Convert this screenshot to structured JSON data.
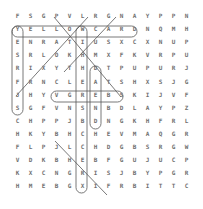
{
  "puzzle": {
    "rows": 14,
    "cols": 14,
    "grid": [
      [
        "F",
        "S",
        "G",
        "P",
        "V",
        "L",
        "R",
        "G",
        "N",
        "A",
        "Y",
        "P",
        "P",
        "N"
      ],
      [
        "Y",
        "E",
        "L",
        "L",
        "O",
        "W",
        "C",
        "A",
        "R",
        "D",
        "N",
        "Q",
        "M",
        "H"
      ],
      [
        "E",
        "N",
        "R",
        "A",
        "T",
        "I",
        "U",
        "S",
        "X",
        "C",
        "X",
        "N",
        "U",
        "P"
      ],
      [
        "S",
        "R",
        "L",
        "O",
        "K",
        "H",
        "M",
        "X",
        "F",
        "K",
        "V",
        "R",
        "P",
        "U"
      ],
      [
        "R",
        "I",
        "X",
        "Y",
        "T",
        "H",
        "D",
        "T",
        "P",
        "U",
        "P",
        "U",
        "R",
        "J"
      ],
      [
        "F",
        "R",
        "N",
        "C",
        "L",
        "E",
        "A",
        "T",
        "S",
        "H",
        "X",
        "S",
        "J",
        "G"
      ],
      [
        "J",
        "H",
        "Y",
        "V",
        "G",
        "R",
        "E",
        "B",
        "S",
        "K",
        "I",
        "J",
        "V",
        "F"
      ],
      [
        "S",
        "G",
        "F",
        "V",
        "N",
        "S",
        "N",
        "B",
        "D",
        "L",
        "A",
        "Y",
        "P",
        "Z"
      ],
      [
        "C",
        "H",
        "P",
        "P",
        "J",
        "B",
        "D",
        "N",
        "G",
        "K",
        "H",
        "F",
        "R",
        "L"
      ],
      [
        "H",
        "K",
        "Y",
        "B",
        "H",
        "C",
        "H",
        "E",
        "V",
        "M",
        "A",
        "Q",
        "G",
        "R"
      ],
      [
        "F",
        "L",
        "P",
        "J",
        "L",
        "C",
        "H",
        "D",
        "G",
        "B",
        "S",
        "R",
        "G",
        "W"
      ],
      [
        "V",
        "D",
        "K",
        "B",
        "H",
        "E",
        "B",
        "F",
        "G",
        "U",
        "J",
        "U",
        "C",
        "P"
      ],
      [
        "K",
        "X",
        "C",
        "N",
        "G",
        "R",
        "I",
        "S",
        "J",
        "B",
        "Y",
        "P",
        "G",
        "R"
      ],
      [
        "H",
        "M",
        "E",
        "B",
        "G",
        "X",
        "I",
        "F",
        "R",
        "B",
        "I",
        "T",
        "T",
        "C"
      ]
    ],
    "found_words": [
      "YELLOWCARD",
      "CLEATS"
    ],
    "highlight_color": "#555555",
    "letter_color": "#6f6f6f"
  }
}
